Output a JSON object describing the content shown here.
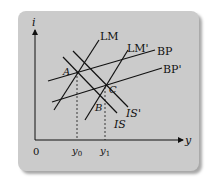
{
  "diagram": {
    "type": "IS-LM-BP model",
    "axes": {
      "y_axis_label": "i",
      "x_axis_label": "y",
      "origin_label": "0"
    },
    "curves": [
      {
        "id": "LM",
        "label": "LM"
      },
      {
        "id": "LM_prime",
        "label": "LM'"
      },
      {
        "id": "BP",
        "label": "BP"
      },
      {
        "id": "BP_prime",
        "label": "BP'"
      },
      {
        "id": "IS",
        "label": "IS"
      },
      {
        "id": "IS_prime",
        "label": "IS'"
      }
    ],
    "points": [
      {
        "id": "A",
        "label": "A"
      },
      {
        "id": "B",
        "label": "B"
      },
      {
        "id": "C",
        "label": "C"
      }
    ],
    "x_ticks": [
      {
        "label": "y",
        "sub": "0"
      },
      {
        "label": "y",
        "sub": "1"
      }
    ],
    "colors": {
      "card_bg": "#cbcbcb",
      "line": "#111111"
    }
  }
}
